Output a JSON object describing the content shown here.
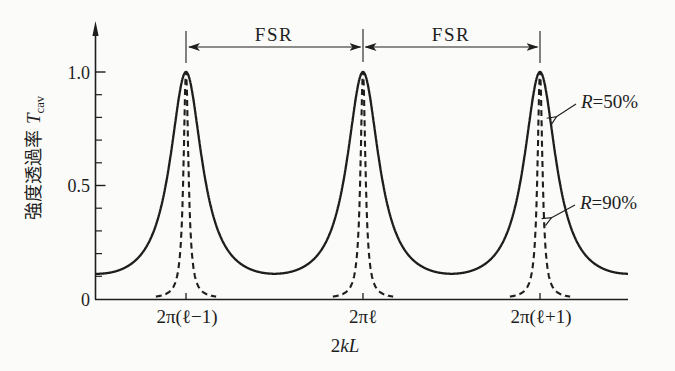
{
  "figure": {
    "background": "#fbfbf9",
    "ink_color": "#1e1e1e"
  },
  "chart_data": {
    "type": "line",
    "title": "",
    "xlabel": "2kL",
    "xlabel_parts": {
      "prefix": "2",
      "var": "kL"
    },
    "ylabel": "強度透過率 T_cav",
    "ylabel_parts": {
      "cjk": "強度透過率",
      "var": "T",
      "sub": "cav"
    },
    "x_tick_labels": [
      "2π(ℓ−1)",
      "2πℓ",
      "2π(ℓ+1)"
    ],
    "x_tick_values_2pi_units": [
      -1,
      0,
      1
    ],
    "y_tick_labels": [
      "0",
      "0.5",
      "1.0"
    ],
    "y_ticks_major": [
      0,
      0.5,
      1.0
    ],
    "y_minor_tick_step": 0.1,
    "xlim_2pi_units": [
      -1.511,
      1.497
    ],
    "ylim": [
      0,
      1.05
    ],
    "grid": false,
    "formula": "T_cav = 1 / (1 + F·sin²(kL)),  F = 4R/(1−R)²",
    "fsr_annotation": {
      "labels": [
        "FSR",
        "FSR"
      ],
      "spans_2pi_units": [
        [
          -1,
          0
        ],
        [
          0,
          1
        ]
      ]
    },
    "series": [
      {
        "name": "R=50%",
        "label": {
          "var": "R",
          "rest": "=50%"
        },
        "R_percent": 50,
        "F": 8,
        "style": "solid",
        "peak_T": 1.0,
        "min_T": 0.111,
        "peaks_at_2pi_units": [
          -1,
          0,
          1
        ]
      },
      {
        "name": "R=90%",
        "label": {
          "var": "R",
          "rest": "=90%"
        },
        "R_percent": 90,
        "F": 360,
        "style": "dashed",
        "peak_T": 1.0,
        "min_T": 0.003,
        "peaks_at_2pi_units": [
          -1,
          0,
          1
        ]
      }
    ]
  }
}
